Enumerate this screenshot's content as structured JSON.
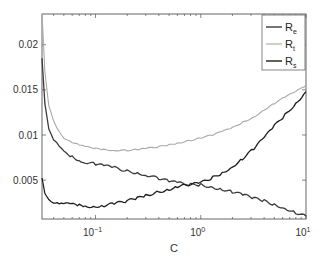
{
  "chart_data": {
    "type": "line",
    "title": "",
    "xlabel": "C",
    "ylabel": "",
    "xscale": "log",
    "xlim": [
      0.031,
      10
    ],
    "ylim": [
      0.0007,
      0.0234
    ],
    "xticks": [
      {
        "value": 0.1,
        "base": "10",
        "exp": "−1"
      },
      {
        "value": 1,
        "base": "10",
        "exp": "0"
      },
      {
        "value": 10,
        "base": "10",
        "exp": "1"
      }
    ],
    "yticks": [
      {
        "value": 0.005,
        "label": "0.005"
      },
      {
        "value": 0.01,
        "label": "0.01"
      },
      {
        "value": 0.015,
        "label": "0.015"
      },
      {
        "value": 0.02,
        "label": "0.02"
      }
    ],
    "grid": false,
    "legend_position": "upper right",
    "series": [
      {
        "name": "Re",
        "label_main": "R",
        "label_sub": "e",
        "color": "#3a3a3a",
        "x": [
          0.031,
          0.033,
          0.036,
          0.04,
          0.045,
          0.05,
          0.06,
          0.07,
          0.08,
          0.1,
          0.12,
          0.15,
          0.2,
          0.25,
          0.3,
          0.4,
          0.5,
          0.6,
          0.8,
          1.0,
          1.3,
          1.6,
          2.0,
          2.5,
          3.2,
          4.0,
          5.0,
          6.3,
          8.0,
          10.0
        ],
        "y": [
          0.0185,
          0.0135,
          0.0108,
          0.0095,
          0.0087,
          0.0081,
          0.0076,
          0.0072,
          0.007,
          0.0068,
          0.0066,
          0.0064,
          0.006,
          0.0058,
          0.0056,
          0.0052,
          0.0049,
          0.0047,
          0.0045,
          0.0045,
          0.0042,
          0.004,
          0.0037,
          0.0034,
          0.003,
          0.0027,
          0.0023,
          0.0019,
          0.0014,
          0.001
        ]
      },
      {
        "name": "Rt",
        "label_main": "R",
        "label_sub": "t",
        "color": "#a8a8a8",
        "x": [
          0.031,
          0.033,
          0.036,
          0.04,
          0.045,
          0.05,
          0.06,
          0.07,
          0.08,
          0.1,
          0.12,
          0.15,
          0.2,
          0.25,
          0.3,
          0.4,
          0.5,
          0.6,
          0.8,
          1.0,
          1.3,
          1.6,
          2.0,
          2.5,
          3.2,
          4.0,
          5.0,
          6.3,
          8.0,
          10.0
        ],
        "y": [
          0.0234,
          0.017,
          0.0132,
          0.0115,
          0.0104,
          0.0097,
          0.0092,
          0.0089,
          0.0087,
          0.0085,
          0.0084,
          0.0083,
          0.0083,
          0.0084,
          0.0085,
          0.0087,
          0.0089,
          0.0091,
          0.0094,
          0.0097,
          0.01,
          0.0104,
          0.0108,
          0.0114,
          0.012,
          0.0128,
          0.0135,
          0.0142,
          0.0148,
          0.0155
        ]
      },
      {
        "name": "Rs",
        "label_main": "R",
        "label_sub": "s",
        "color": "#1e1e1e",
        "x": [
          0.031,
          0.033,
          0.036,
          0.04,
          0.045,
          0.05,
          0.06,
          0.07,
          0.08,
          0.1,
          0.12,
          0.15,
          0.2,
          0.25,
          0.3,
          0.4,
          0.5,
          0.6,
          0.8,
          1.0,
          1.3,
          1.6,
          2.0,
          2.5,
          3.2,
          4.0,
          5.0,
          6.3,
          8.0,
          10.0
        ],
        "y": [
          0.0052,
          0.0035,
          0.0029,
          0.0026,
          0.0025,
          0.0024,
          0.0023,
          0.0022,
          0.0021,
          0.0021,
          0.0022,
          0.0024,
          0.0027,
          0.003,
          0.0033,
          0.0037,
          0.004,
          0.0043,
          0.0045,
          0.0047,
          0.0053,
          0.0058,
          0.0065,
          0.0074,
          0.0085,
          0.0097,
          0.011,
          0.0122,
          0.0135,
          0.0148
        ]
      }
    ]
  },
  "axes": {
    "x_label": "C"
  }
}
